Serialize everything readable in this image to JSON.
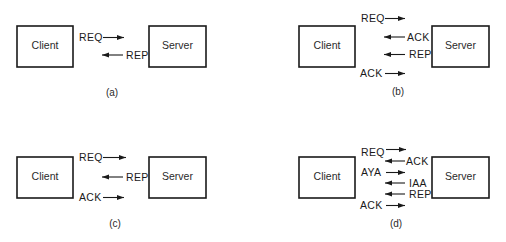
{
  "figure": {
    "panels": [
      {
        "id": "a",
        "caption": "(a)",
        "client_label": "Client",
        "server_label": "Server",
        "messages": [
          {
            "label": "REQ",
            "direction": "client-to-server"
          },
          {
            "label": "REP",
            "direction": "server-to-client"
          }
        ]
      },
      {
        "id": "b",
        "caption": "(b)",
        "client_label": "Client",
        "server_label": "Server",
        "messages": [
          {
            "label": "REQ",
            "direction": "client-to-server"
          },
          {
            "label": "ACK",
            "direction": "server-to-client"
          },
          {
            "label": "REP",
            "direction": "server-to-client"
          },
          {
            "label": "ACK",
            "direction": "client-to-server"
          }
        ]
      },
      {
        "id": "c",
        "caption": "(c)",
        "client_label": "Client",
        "server_label": "Server",
        "messages": [
          {
            "label": "REQ",
            "direction": "client-to-server"
          },
          {
            "label": "REP",
            "direction": "server-to-client"
          },
          {
            "label": "ACK",
            "direction": "client-to-server"
          }
        ]
      },
      {
        "id": "d",
        "caption": "(d)",
        "client_label": "Client",
        "server_label": "Server",
        "messages": [
          {
            "label": "REQ",
            "direction": "client-to-server"
          },
          {
            "label": "ACK",
            "direction": "server-to-client"
          },
          {
            "label": "AYA",
            "direction": "client-to-server"
          },
          {
            "label": "IAA",
            "direction": "server-to-client"
          },
          {
            "label": "REP",
            "direction": "server-to-client"
          },
          {
            "label": "ACK",
            "direction": "client-to-server"
          }
        ]
      }
    ]
  }
}
